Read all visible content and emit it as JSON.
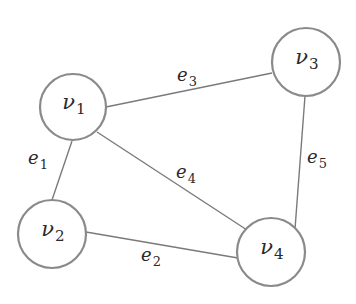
{
  "diagram": {
    "type": "undirected-graph",
    "colors": {
      "node_stroke": "#8a8a8a",
      "edge_stroke": "#7a7a7a",
      "text": "#2a2a2a",
      "background": "#ffffff"
    },
    "nodes": [
      {
        "id": "v1",
        "base": "ν",
        "sub": "1",
        "cx": 73,
        "cy": 107,
        "r": 33
      },
      {
        "id": "v2",
        "base": "ν",
        "sub": "2",
        "cx": 52,
        "cy": 234,
        "r": 34
      },
      {
        "id": "v3",
        "base": "ν",
        "sub": "3",
        "cx": 306,
        "cy": 62,
        "r": 34
      },
      {
        "id": "v4",
        "base": "ν",
        "sub": "4",
        "cx": 271,
        "cy": 252,
        "r": 34
      }
    ],
    "edges": [
      {
        "id": "e1",
        "base": "e",
        "sub": "1",
        "from": "v1",
        "to": "v2",
        "x1": 72,
        "y1": 141,
        "x2": 52,
        "y2": 200,
        "lx": 38,
        "ly": 160
      },
      {
        "id": "e2",
        "base": "e",
        "sub": "2",
        "from": "v2",
        "to": "v4",
        "x1": 86,
        "y1": 232,
        "x2": 238,
        "y2": 258,
        "lx": 151,
        "ly": 257
      },
      {
        "id": "e3",
        "base": "e",
        "sub": "3",
        "from": "v1",
        "to": "v3",
        "x1": 106,
        "y1": 107,
        "x2": 272,
        "y2": 73,
        "lx": 187,
        "ly": 77
      },
      {
        "id": "e4",
        "base": "e",
        "sub": "4",
        "from": "v1",
        "to": "v4",
        "x1": 97,
        "y1": 132,
        "x2": 247,
        "y2": 230,
        "lx": 186,
        "ly": 174
      },
      {
        "id": "e5",
        "base": "e",
        "sub": "5",
        "from": "v3",
        "to": "v4",
        "x1": 305,
        "y1": 96,
        "x2": 295,
        "y2": 229,
        "lx": 317,
        "ly": 159
      }
    ]
  }
}
